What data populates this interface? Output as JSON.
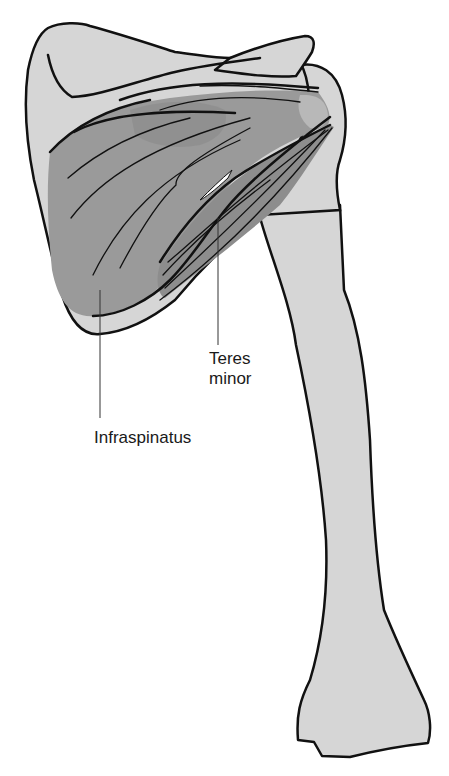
{
  "figure": {
    "labels": {
      "teres_minor_line1": "Teres",
      "teres_minor_line2": "minor",
      "infraspinatus": "Infraspinatus"
    },
    "colors": {
      "bone": "#d6d6d6",
      "muscle_dark": "#8f8f8f",
      "muscle_mid": "#a5a5a5",
      "muscle_light": "#bcbcbc",
      "outline": "#111111",
      "leader_line": "#333333",
      "background": "#ffffff"
    }
  }
}
